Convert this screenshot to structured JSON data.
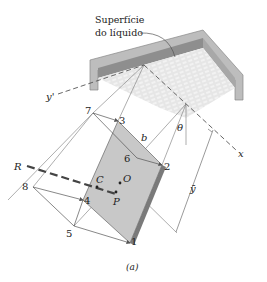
{
  "figure": {
    "caption": "(a)",
    "surface_label_line1": "Superfície",
    "surface_label_line2": "do líquido",
    "axes": {
      "y_prime": "y'",
      "x": "x"
    },
    "angle_label": "θ",
    "depth_label": "ȳ",
    "dimension_label": "b",
    "points": {
      "p1": "1",
      "p2": "2",
      "p3": "3",
      "p4": "4",
      "p5": "5",
      "p6": "6",
      "p7": "7",
      "p8": "8"
    },
    "resultant_label": "R",
    "centroid_label": "C",
    "origin_label": "O",
    "pressure_center_label": "P",
    "colors": {
      "plate_face": "#c8c8c8",
      "plate_edge": "#7a7a7a",
      "tank_wall": "#9a9a9a",
      "liquid": "#e4e4e4",
      "line": "#555555"
    }
  }
}
